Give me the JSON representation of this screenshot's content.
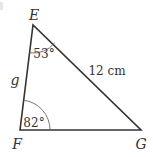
{
  "diagram": {
    "type": "triangle",
    "vertices": {
      "E": {
        "label": "E",
        "x": 33,
        "y": 25
      },
      "F": {
        "label": "F",
        "x": 20,
        "y": 130
      },
      "G": {
        "label": "G",
        "x": 141,
        "y": 130
      }
    },
    "sides": {
      "EF": {
        "label": "g"
      },
      "EG": {
        "label": "12 cm"
      }
    },
    "angles": {
      "E": {
        "label": "53°"
      },
      "F": {
        "label": "82°"
      }
    },
    "colors": {
      "line": "#333333",
      "arc": "#666666",
      "text": "#333333"
    }
  }
}
